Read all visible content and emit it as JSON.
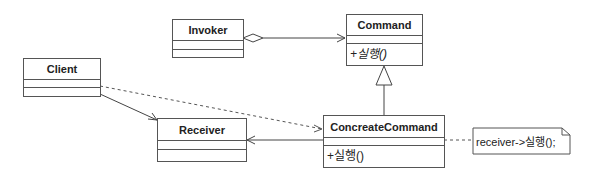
{
  "diagram": {
    "type": "uml-class",
    "classes": [
      {
        "id": "invoker",
        "name": "Invoker",
        "attributes": [],
        "operations": []
      },
      {
        "id": "command",
        "name": "Command",
        "attributes": [],
        "operations": [
          "+실행()"
        ],
        "abstract_ops": true
      },
      {
        "id": "client",
        "name": "Client",
        "attributes": [],
        "operations": []
      },
      {
        "id": "receiver",
        "name": "Receiver",
        "attributes": [],
        "operations": []
      },
      {
        "id": "concrete",
        "name": "ConcreateCommand",
        "attributes": [],
        "operations": [
          "+실행()"
        ]
      }
    ],
    "note": {
      "text": "receiver->실행();",
      "attached_to": "concrete"
    },
    "relations": [
      {
        "from": "Invoker",
        "to": "Command",
        "type": "aggregation"
      },
      {
        "from": "ConcreateCommand",
        "to": "Command",
        "type": "generalization"
      },
      {
        "from": "Client",
        "to": "Receiver",
        "type": "association"
      },
      {
        "from": "Client",
        "to": "ConcreateCommand",
        "type": "dependency"
      },
      {
        "from": "ConcreateCommand",
        "to": "Receiver",
        "type": "association"
      }
    ]
  }
}
